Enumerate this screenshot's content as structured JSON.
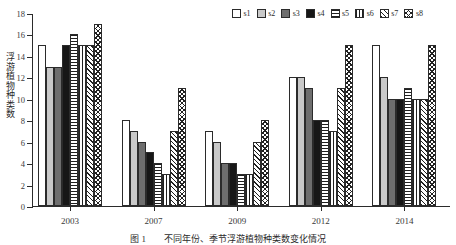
{
  "chart_data": {
    "type": "bar",
    "title": "",
    "xlabel": "",
    "ylabel": "浮游植物种类数",
    "ylim": [
      0,
      18
    ],
    "ytick_step": 2,
    "yticks": [
      "18",
      "16",
      "14",
      "12",
      "10",
      "8",
      "6",
      "4",
      "2",
      "0"
    ],
    "grid": false,
    "legend_position": "top-right",
    "categories": [
      "2003",
      "2007",
      "2009",
      "2012",
      "2014"
    ],
    "series": [
      {
        "name": "s1",
        "pattern": "solid-white",
        "color": "#ffffff",
        "values": [
          15,
          8,
          7,
          12,
          15
        ]
      },
      {
        "name": "s2",
        "pattern": "solid-light-gray",
        "color": "#c9c9c9",
        "values": [
          13,
          7,
          6,
          12,
          12
        ]
      },
      {
        "name": "s3",
        "pattern": "solid-dark-gray",
        "color": "#6e6e6e",
        "values": [
          13,
          6,
          4,
          11,
          10
        ]
      },
      {
        "name": "s4",
        "pattern": "solid-black",
        "color": "#171717",
        "values": [
          15,
          5,
          4,
          8,
          10
        ]
      },
      {
        "name": "s5",
        "pattern": "horizontal-lines",
        "color": "#202020",
        "values": [
          16,
          4,
          3,
          8,
          11
        ]
      },
      {
        "name": "s6",
        "pattern": "vertical-lines",
        "color": "#202020",
        "values": [
          15,
          3,
          3,
          7,
          10
        ]
      },
      {
        "name": "s7",
        "pattern": "diagonal-hatch",
        "color": "#202020",
        "values": [
          15,
          7,
          6,
          11,
          10
        ]
      },
      {
        "name": "s8",
        "pattern": "cross-hatch",
        "color": "#202020",
        "values": [
          17,
          11,
          8,
          15,
          15
        ]
      }
    ]
  },
  "legend": {
    "items": [
      {
        "label": "s1"
      },
      {
        "label": "s2"
      },
      {
        "label": "s3"
      },
      {
        "label": "s4"
      },
      {
        "label": "s5"
      },
      {
        "label": "s6"
      },
      {
        "label": "s7"
      },
      {
        "label": "s8"
      }
    ]
  },
  "axes": {
    "y_title": "浮游植物种类数"
  },
  "caption": {
    "text": "图 1　　不同年份、季节浮游植物种类数变化情况"
  }
}
